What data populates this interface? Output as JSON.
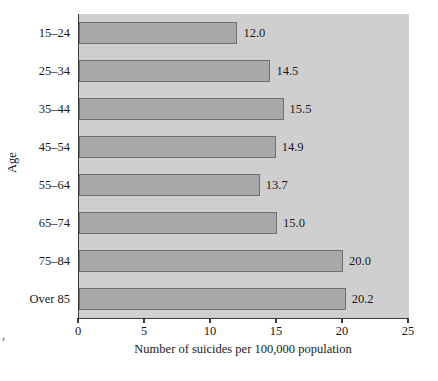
{
  "chart_data": {
    "type": "bar",
    "orientation": "horizontal",
    "title": "",
    "xlabel": "Number of suicides per 100,000 population",
    "ylabel": "Age",
    "categories": [
      "15–24",
      "25–34",
      "35–44",
      "45–54",
      "55–64",
      "65–74",
      "75–84",
      "Over 85"
    ],
    "values": [
      12.0,
      14.5,
      15.5,
      14.9,
      13.7,
      15.0,
      20.0,
      20.2
    ],
    "value_labels": [
      "12.0",
      "14.5",
      "15.5",
      "14.9",
      "13.7",
      "15.0",
      "20.0",
      "20.2"
    ],
    "xlim": [
      0,
      25
    ],
    "xticks": [
      0,
      5,
      10,
      15,
      20,
      25
    ],
    "xtick_labels": [
      "0",
      "5",
      "10",
      "15",
      "20",
      "25"
    ],
    "grid": false,
    "legend": null,
    "colors": {
      "plot_background": "#cfcfcf",
      "bar_fill": "#a8a8a8",
      "bar_edge": "#6f6f6f",
      "axis": "#3a3a3a",
      "text": "#1a1a1a"
    }
  },
  "marks": {
    "corner": ","
  }
}
